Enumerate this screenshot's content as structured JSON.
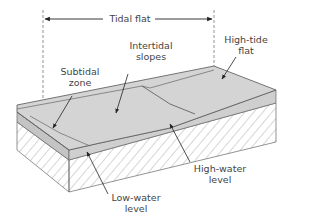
{
  "figure": {
    "colors": {
      "surface": "#d4d4d4",
      "subtidal_strip": "#c4c4c4",
      "hatch": "#8a8a8a",
      "outline": "#666666",
      "text": "#444444"
    }
  },
  "labels": {
    "tidal_flat": "Tidal flat",
    "high_tide_flat": "High-tide\nflat",
    "intertidal_slopes": "Intertidal\nslopes",
    "subtidal_zone": "Subtidal\nzone",
    "high_water_level": "High-water\nlevel",
    "low_water_level": "Low-water\nlevel"
  }
}
